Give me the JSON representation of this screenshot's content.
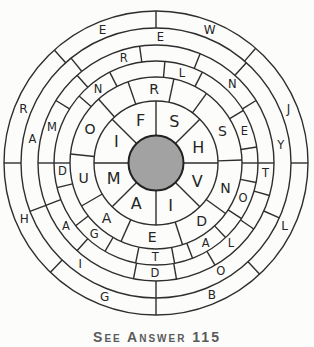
{
  "figure": {
    "center": {
      "x": 156,
      "y": 163
    },
    "background": "#fcfcfa",
    "line_color": "#2e2e2e",
    "line_width": 1.4,
    "hub": {
      "radius": 27.5,
      "fill": "#a2a2a2",
      "stroke": "#222222",
      "stroke_width": 2
    },
    "ring_boundaries": [
      62,
      86,
      102,
      118,
      135,
      152
    ],
    "rings": [
      {
        "name": "ring-1",
        "inner": 27.5,
        "outer": 62,
        "letter_radius": 45,
        "font_size": 16,
        "dividers": [
          0,
          45,
          90,
          135,
          180,
          225,
          270,
          315
        ],
        "letters": [
          {
            "char": "S",
            "angle": 24
          },
          {
            "char": "H",
            "angle": 70
          },
          {
            "char": "V",
            "angle": 114
          },
          {
            "char": "I",
            "angle": 161
          },
          {
            "char": "A",
            "angle": 206
          },
          {
            "char": "M",
            "angle": 250
          },
          {
            "char": "I",
            "angle": 298
          },
          {
            "char": "F",
            "angle": 340
          }
        ]
      },
      {
        "name": "ring-2",
        "inner": 62,
        "outer": 86,
        "letter_radius": 74,
        "font_size": 14,
        "dividers": [
          341,
          12,
          36,
          88,
          126,
          162,
          204,
          240,
          276,
          318
        ],
        "letters": [
          {
            "char": "R",
            "angle": 358.5
          },
          {
            "char": "S",
            "angle": 64
          },
          {
            "char": "N",
            "angle": 110
          },
          {
            "char": "D",
            "angle": 142
          },
          {
            "char": "E",
            "angle": 183
          },
          {
            "char": "A",
            "angle": 222
          },
          {
            "char": "U",
            "angle": 258
          },
          {
            "char": "O",
            "angle": 297
          }
        ]
      },
      {
        "name": "ring-3",
        "inner": 86,
        "outer": 102,
        "letter_radius": 94,
        "font_size": 11.5,
        "dividers": [
          5,
          27,
          59,
          81,
          90,
          101,
          123,
          137,
          159,
          169.5,
          191.5,
          210,
          232,
          256,
          270,
          311,
          333
        ],
        "letters": [
          {
            "char": "L",
            "angle": 16
          },
          {
            "char": "E",
            "angle": 70
          },
          {
            "char": "O",
            "angle": 112
          },
          {
            "char": "A",
            "angle": 148
          },
          {
            "char": "T",
            "angle": 180.5
          },
          {
            "char": "G",
            "angle": 221
          },
          {
            "char": "D",
            "angle": 265
          },
          {
            "char": "N",
            "angle": 322
          }
        ]
      },
      {
        "name": "ring-4",
        "inner": 102,
        "outer": 118,
        "letter_radius": 110,
        "font_size": 11.5,
        "dividers": [
          318,
          352,
          22,
          58,
          90,
          106,
          124,
          150,
          170,
          191,
          222,
          249,
          270,
          302
        ],
        "letters": [
          {
            "char": "R",
            "angle": 343
          },
          {
            "char": "N",
            "angle": 44
          },
          {
            "char": "T",
            "angle": 95
          },
          {
            "char": "L",
            "angle": 137
          },
          {
            "char": "D",
            "angle": 180.5
          },
          {
            "char": "A",
            "angle": 235
          },
          {
            "char": "M",
            "angle": 289
          }
        ]
      },
      {
        "name": "ring-5",
        "inner": 118,
        "outer": 135,
        "letter_radius": 126,
        "font_size": 11.5,
        "dividers": [
          42,
          114,
          180,
          249,
          321
        ],
        "letters": [
          {
            "char": "E",
            "angle": 2
          },
          {
            "char": "Y",
            "angle": 82
          },
          {
            "char": "O",
            "angle": 149
          },
          {
            "char": "I",
            "angle": 217
          },
          {
            "char": "A",
            "angle": 281
          }
        ]
      },
      {
        "name": "ring-6",
        "inner": 135,
        "outer": 152,
        "letter_radius": 143,
        "font_size": 12,
        "dividers": [
          0,
          41,
          90,
          137,
          180,
          224,
          270,
          318
        ],
        "letters": [
          {
            "char": "W",
            "angle": 22
          },
          {
            "char": "J",
            "angle": 68
          },
          {
            "char": "L",
            "angle": 116
          },
          {
            "char": "B",
            "angle": 157
          },
          {
            "char": "G",
            "angle": 201
          },
          {
            "char": "H",
            "angle": 247
          },
          {
            "char": "R",
            "angle": 292
          },
          {
            "char": "E",
            "angle": 338
          }
        ]
      }
    ]
  },
  "caption": {
    "text": "See Answer 115"
  }
}
